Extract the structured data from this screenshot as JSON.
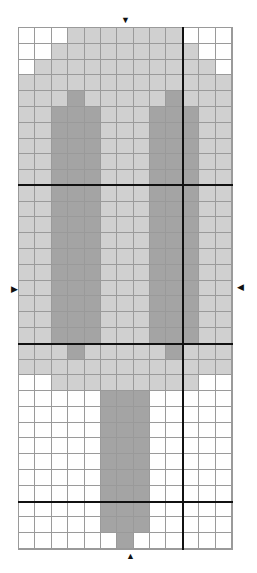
{
  "chart": {
    "columns": 13,
    "rows": 33,
    "legend": {
      "W": "#ffffff",
      "L": "#d0d0d0",
      "D": "#a4a4a4"
    },
    "grid_line_color": "#9a9a9a",
    "thick_line_color": "#111111",
    "thick_vertical_after_columns": [
      10
    ],
    "thick_horizontal_after_rows": [
      10,
      20,
      30
    ],
    "pattern": [
      "WWWLLLLLLLWWW",
      "WWLLLLLLLLLWW",
      "WLLLLLLLLLLLW",
      "LLLLLLLLLLLLL",
      "LLLDLLLLLDLLL",
      "LLDDDLLLDDDLL",
      "LLDDDLLLDDDLL",
      "LLDDDLLLDDDLL",
      "LLDDDLLLDDDLL",
      "LLDDDLLLDDDLL",
      "LLDDDLLLDDDLL",
      "LLDDDLLLDDDLL",
      "LLDDDLLLDDDLL",
      "LLDDDLLLDDDLL",
      "LLDDDLLLDDDLL",
      "LLDDDLLLDDDLL",
      "LLDDDLLLDDDLL",
      "LLDDDLLLDDDLL",
      "LLDDDLLLDDDLL",
      "LLDDDLLLDDDLL",
      "LLLDLLLLLDLLL",
      "LLLLLLLLLLLLL",
      "WWLLLLLLLLLWW",
      "WWWWWDDDWWWWW",
      "WWWWWDDDWWWWW",
      "WWWWWDDDWWWWW",
      "WWWWWDDDWWWWW",
      "WWWWWDDDWWWWW",
      "WWWWWDDDWWWWW",
      "WWWWWDDDWWWWW",
      "WWWWWDDDWWWWW",
      "WWWWWDDDWWWWW",
      "WWWWWWDWWWWWW"
    ]
  },
  "markers": {
    "top": "▼",
    "bottom": "▲",
    "left": "▶",
    "right": "◀"
  }
}
